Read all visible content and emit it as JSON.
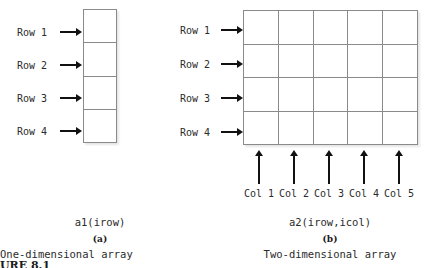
{
  "figure": {
    "number_label": "URE 8.1",
    "panel_a": {
      "letter": "(a)",
      "notation": "a1(irow)",
      "title": "One-dimensional array",
      "rows": 4,
      "cols": 1,
      "row_labels": [
        "Row 1",
        "Row 2",
        "Row 3",
        "Row 4"
      ],
      "col_labels": []
    },
    "panel_b": {
      "letter": "(b)",
      "notation": "a2(irow,icol)",
      "title": "Two-dimensional array",
      "rows": 4,
      "cols": 5,
      "row_labels": [
        "Row 1",
        "Row 2",
        "Row 3",
        "Row 4"
      ],
      "col_labels": [
        "Col 1",
        "Col 2",
        "Col 3",
        "Col 4",
        "Col 5"
      ]
    }
  },
  "colors": {
    "grid_line": "#8a8a8a",
    "cell_fill": "#ffffff",
    "arrow": "#111111",
    "text": "#2b2b2b",
    "background": "#ffffff"
  }
}
